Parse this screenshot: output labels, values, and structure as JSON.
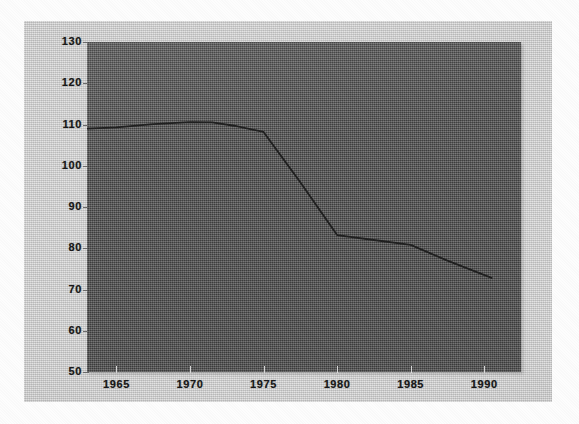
{
  "chart_data": {
    "type": "line",
    "title": "",
    "subtitle": "",
    "xlabel": "",
    "ylabel": "",
    "xlim": [
      1963,
      1992.5
    ],
    "ylim": [
      50,
      130
    ],
    "xticks": [
      1965,
      1970,
      1975,
      1980,
      1985,
      1990
    ],
    "xtick_labels": [
      "1965",
      "1970",
      "1975",
      "1980",
      "1985",
      "1990"
    ],
    "yticks": [
      50,
      60,
      70,
      80,
      90,
      100,
      110,
      120,
      130
    ],
    "ytick_labels": [
      "50",
      "60",
      "70",
      "80",
      "90",
      "100",
      "110",
      "120",
      "130"
    ],
    "grid": false,
    "legend": false,
    "legend_position": "none",
    "annotations": [],
    "series": [
      {
        "name": "series-1",
        "color": "#1e1e1e",
        "x": [
          1963.0,
          1965.0,
          1967.5,
          1970.0,
          1971.5,
          1973.0,
          1975.0,
          1977.5,
          1980.0,
          1982.5,
          1985.0,
          1987.5,
          1990.5
        ],
        "values": [
          109.0,
          109.3,
          110.1,
          110.6,
          110.5,
          109.7,
          108.2,
          96.0,
          83.2,
          82.0,
          80.8,
          77.0,
          72.8
        ]
      }
    ]
  },
  "axes": {
    "y_axis_name": "value-axis",
    "x_axis_name": "year-axis"
  },
  "figure": {
    "background_color": "#c6c6c6",
    "plot_background_color": "#565656",
    "line_color": "#1e1e1e",
    "tick_label_color": "#161616"
  }
}
